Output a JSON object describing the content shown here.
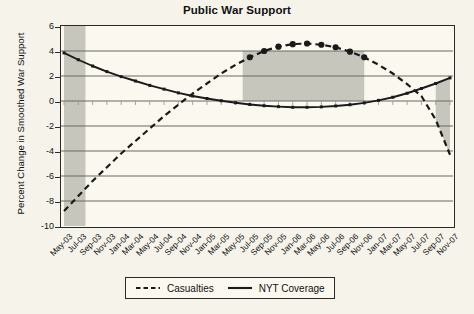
{
  "chart_data": {
    "type": "line",
    "title": "Public War Support",
    "xlabel": "",
    "ylabel": "Percent Change in Smoothed War Support",
    "ylim": [
      -10,
      6
    ],
    "yticks": [
      6,
      4,
      2,
      0,
      -2,
      -4,
      -6,
      -8,
      -10
    ],
    "grid": true,
    "legend_position": "bottom",
    "categories": [
      "May-03",
      "Jul-03",
      "Sep-03",
      "Nov-03",
      "Jan-04",
      "Mar-04",
      "May-04",
      "Jul-04",
      "Sep-04",
      "Nov-04",
      "Jan-05",
      "Mar-05",
      "May-05",
      "Jul-05",
      "Sep-05",
      "Nov-05",
      "Jan-06",
      "Mar-06",
      "May-06",
      "Jul-06",
      "Sep-06",
      "Nov-06",
      "Jan-07",
      "Mar-07",
      "May-07",
      "Jul-07",
      "Sep-07",
      "Nov-07"
    ],
    "series": [
      {
        "name": "Casualties",
        "style": "dashed",
        "marker": "circle",
        "values": [
          -8.8,
          -7.6,
          -6.4,
          -5.3,
          -4.2,
          -3.2,
          -2.2,
          -1.2,
          -0.3,
          0.6,
          1.4,
          2.2,
          2.9,
          3.5,
          4.0,
          4.35,
          4.55,
          4.6,
          4.5,
          4.3,
          3.95,
          3.5,
          2.9,
          2.2,
          1.35,
          0.4,
          -1.5,
          -4.3
        ]
      },
      {
        "name": "NYT Coverage",
        "style": "solid",
        "marker": "square",
        "values": [
          3.85,
          3.3,
          2.8,
          2.35,
          1.95,
          1.6,
          1.25,
          0.95,
          0.65,
          0.4,
          0.2,
          0.02,
          -0.14,
          -0.28,
          -0.38,
          -0.45,
          -0.5,
          -0.5,
          -0.47,
          -0.4,
          -0.3,
          -0.15,
          0.05,
          0.3,
          0.62,
          1.0,
          1.4,
          1.85
        ]
      }
    ],
    "shaded_regions": [
      {
        "label": "early-war-shading",
        "x_start": "May-03",
        "x_end": "Aug-03",
        "y_bottom": -10,
        "y_top": 6
      },
      {
        "label": "mid-war-shading",
        "x_start": "Jun-05",
        "x_end": "Nov-06",
        "y_bottom": 0,
        "y_top": 4
      },
      {
        "label": "late-war-shading",
        "x_start": "Sep-07",
        "x_end": "Nov-07",
        "y_bottom": -2,
        "y_top": 2
      }
    ],
    "colors": {
      "background": "#f5f3ea",
      "plot_background": "#faf8ef",
      "shading": "#c6c6bd",
      "axis": "#2a2a2a",
      "gridline": "#6b6b63",
      "series_casualties": "#1a1a1a",
      "series_nyt": "#1a1a1a"
    }
  },
  "legend": {
    "items": [
      {
        "label": "Casualties",
        "style": "dashed"
      },
      {
        "label": "NYT Coverage",
        "style": "solid"
      }
    ]
  }
}
